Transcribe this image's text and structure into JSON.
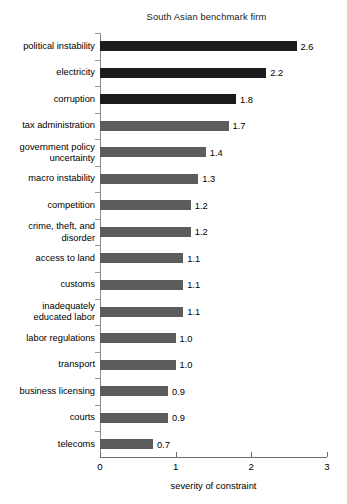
{
  "chart_data": {
    "type": "bar",
    "orientation": "horizontal",
    "title": "South Asian benchmark firm",
    "xlabel": "severity of constraint",
    "ylabel": "",
    "xlim": [
      0,
      3
    ],
    "xticks": [
      "0",
      "1",
      "2",
      "3"
    ],
    "grid": false,
    "legend": null,
    "categories": [
      "political instability",
      "electricity",
      "corruption",
      "tax administration",
      "government policy\nuncertainty",
      "macro instability",
      "competition",
      "crime, theft, and\ndisorder",
      "access to land",
      "customs",
      "inadequately\neducated labor",
      "labor regulations",
      "transport",
      "business licensing",
      "courts",
      "telecoms"
    ],
    "values": [
      2.6,
      2.2,
      1.8,
      1.7,
      1.4,
      1.3,
      1.2,
      1.2,
      1.1,
      1.1,
      1.1,
      1.0,
      1.0,
      0.9,
      0.9,
      0.7
    ],
    "value_labels": [
      "2.6",
      "2.2",
      "1.8",
      "1.7",
      "1.4",
      "1.3",
      "1.2",
      "1.2",
      "1.1",
      "1.1",
      "1.1",
      "1.0",
      "1.0",
      "0.9",
      "0.9",
      "0.7"
    ],
    "bar_colors": [
      "#1c1c1c",
      "#1c1c1c",
      "#1c1c1c",
      "#5c5c5c",
      "#5c5c5c",
      "#5c5c5c",
      "#5c5c5c",
      "#5c5c5c",
      "#5c5c5c",
      "#5c5c5c",
      "#5c5c5c",
      "#5c5c5c",
      "#5c5c5c",
      "#5c5c5c",
      "#5c5c5c",
      "#5c5c5c"
    ],
    "colors": {
      "dark_bar": "#1c1c1c",
      "gray_bar": "#5c5c5c",
      "axis": "#6e6e6e",
      "text": "#000000",
      "background": "#ffffff"
    }
  }
}
